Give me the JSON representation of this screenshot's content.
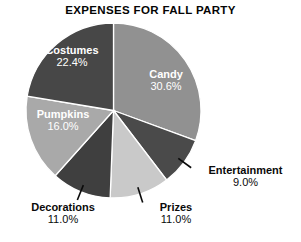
{
  "chart_data": {
    "type": "pie",
    "title": "EXPENSES FOR FALL PARTY",
    "xlabel": "",
    "ylabel": "",
    "legend": "none",
    "grid": false,
    "units": "percent",
    "categories": [
      "Candy",
      "Entertainment",
      "Prizes",
      "Decorations",
      "Pumpkins",
      "Costumes"
    ],
    "values": [
      30.6,
      9.0,
      11.0,
      11.0,
      16.0,
      22.4
    ],
    "value_labels": [
      "30.6%",
      "9.0%",
      "11.0%",
      "11.0%",
      "16.0%",
      "22.4%"
    ],
    "start_angle_deg": 0,
    "direction": "clockwise",
    "slices": [
      {
        "name": "Candy",
        "value": 30.6,
        "value_label": "30.6%",
        "color": "#919191",
        "label_position": "inside",
        "start_deg": 0.0,
        "end_deg": 110.2
      },
      {
        "name": "Entertainment",
        "value": 9.0,
        "value_label": "9.0%",
        "color": "#4a4a4a",
        "label_position": "outside",
        "start_deg": 110.2,
        "end_deg": 142.6
      },
      {
        "name": "Prizes",
        "value": 11.0,
        "value_label": "11.0%",
        "color": "#c9c9c9",
        "label_position": "outside",
        "start_deg": 142.6,
        "end_deg": 182.2
      },
      {
        "name": "Decorations",
        "value": 11.0,
        "value_label": "11.0%",
        "color": "#3f3f3f",
        "label_position": "outside",
        "start_deg": 182.2,
        "end_deg": 221.8
      },
      {
        "name": "Pumpkins",
        "value": 16.0,
        "value_label": "16.0%",
        "color": "#a9a9a9",
        "label_position": "inside",
        "start_deg": 221.8,
        "end_deg": 279.4
      },
      {
        "name": "Costumes",
        "value": 22.4,
        "value_label": "22.4%",
        "color": "#474747",
        "label_position": "inside",
        "start_deg": 279.4,
        "end_deg": 360.0
      }
    ],
    "background_color": "#ffffff",
    "title_color": "#050505",
    "outside_label_color": "#0a0a0a",
    "inside_label_color": "#ffffff"
  }
}
